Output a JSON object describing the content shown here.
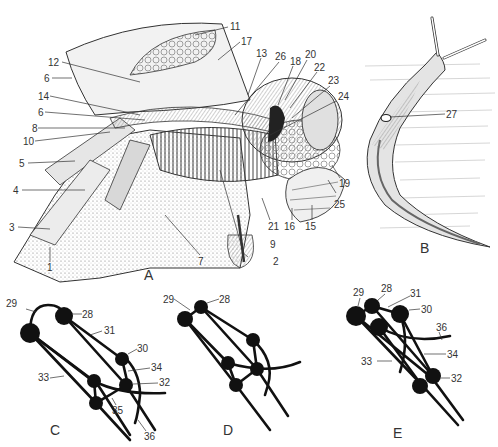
{
  "figure": {
    "panels": {
      "A": {
        "letter": "A",
        "description": "Internal anatomy dissection, lateral view",
        "labels": {
          "l1": "1",
          "l2": "2",
          "l3": "3",
          "l4": "4",
          "l5": "5",
          "l6a": "6",
          "l6b": "6",
          "l7": "7",
          "l8": "8",
          "l9": "9",
          "l10": "10",
          "l11": "11",
          "l12": "12",
          "l13": "13",
          "l14": "14",
          "l15": "15",
          "l16": "16",
          "l17": "17",
          "l18": "18",
          "l19": "19",
          "l20": "20",
          "l21": "21",
          "l22": "22",
          "l23": "23",
          "l24": "24",
          "l25": "25",
          "l26": "26"
        }
      },
      "B": {
        "letter": "B",
        "description": "Whole slug, dorsolateral view",
        "labels": {
          "l27": "27"
        }
      },
      "C": {
        "letter": "C",
        "description": "Nervous system ganglia schematic",
        "labels": {
          "l28": "28",
          "l29": "29",
          "l30": "30",
          "l31": "31",
          "l32": "32",
          "l33": "33",
          "l34": "34",
          "l35": "35",
          "l36": "36"
        }
      },
      "D": {
        "letter": "D",
        "description": "Nervous system ganglia schematic",
        "labels": {
          "l28": "28",
          "l29": "29"
        }
      },
      "E": {
        "letter": "E",
        "description": "Nervous system ganglia schematic",
        "labels": {
          "l28": "28",
          "l29": "29",
          "l30": "30",
          "l31": "31",
          "l32": "32",
          "l33": "33",
          "l34": "34",
          "l36": "36"
        }
      }
    },
    "colors": {
      "ink": "#111111",
      "label": "#333333",
      "shade": "#9a9a9a",
      "background": "#ffffff"
    }
  }
}
